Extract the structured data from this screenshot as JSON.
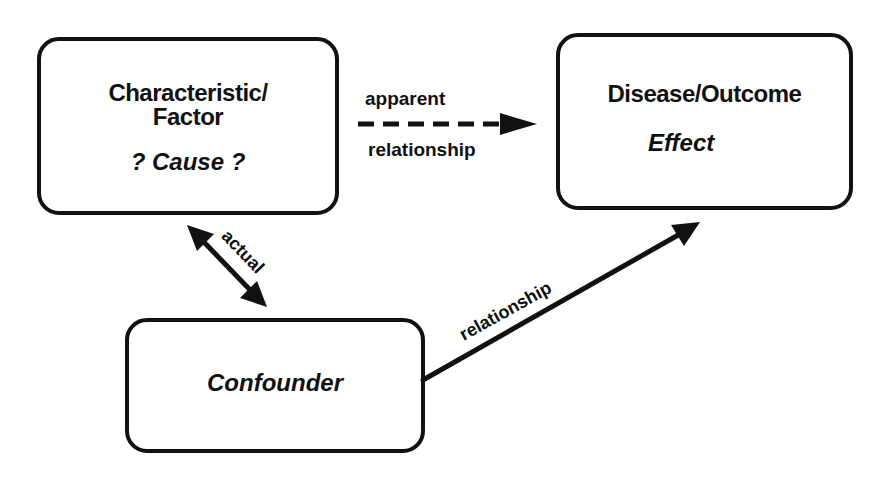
{
  "diagram": {
    "type": "confounding-diagram",
    "nodes": {
      "factor": {
        "line1": "Characteristic/",
        "line2": "Factor",
        "role": "? Cause ?"
      },
      "outcome": {
        "line1": "Disease/Outcome",
        "role": "Effect"
      },
      "confounder": {
        "label": "Confounder"
      }
    },
    "edges": {
      "apparent": {
        "label_top": "apparent",
        "label_bottom": "relationship",
        "style": "dashed",
        "from": "factor",
        "to": "outcome"
      },
      "actual": {
        "label": "actual",
        "style": "solid-double-headed",
        "from": "factor",
        "to": "confounder"
      },
      "relationship": {
        "label": "relationship",
        "style": "solid",
        "from": "confounder",
        "to": "outcome"
      }
    },
    "colors": {
      "stroke": "#111111",
      "background": "#ffffff"
    }
  }
}
